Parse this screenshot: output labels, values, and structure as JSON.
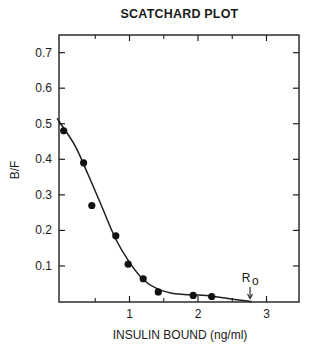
{
  "chart_data": {
    "type": "scatter",
    "title": "SCATCHARD PLOT",
    "xlabel": "INSULIN BOUND (ng/ml)",
    "ylabel": "B/F",
    "xlim": [
      0,
      3.5
    ],
    "ylim": [
      0,
      0.75
    ],
    "x_ticks": [
      1,
      2,
      3
    ],
    "x_minor_ticks": [
      0.5,
      1.5,
      2.5
    ],
    "y_ticks": [
      0.1,
      0.2,
      0.3,
      0.4,
      0.5,
      0.6,
      0.7
    ],
    "y_tick_labels": [
      "0.1",
      "0.2",
      "0.3",
      "0.4",
      "0.5",
      "0.6",
      "0.7"
    ],
    "x_tick_labels": [
      "1",
      "2",
      "3"
    ],
    "grid": false,
    "legend": null,
    "series": [
      {
        "name": "Measured points",
        "style": "filled-circle",
        "points": [
          {
            "x": 0.04,
            "y": 0.48
          },
          {
            "x": 0.33,
            "y": 0.39
          },
          {
            "x": 0.45,
            "y": 0.27
          },
          {
            "x": 0.8,
            "y": 0.185
          },
          {
            "x": 0.98,
            "y": 0.105
          },
          {
            "x": 1.2,
            "y": 0.064
          },
          {
            "x": 1.42,
            "y": 0.027
          },
          {
            "x": 1.93,
            "y": 0.017
          },
          {
            "x": 2.2,
            "y": 0.014
          }
        ]
      },
      {
        "name": "Fitted curve",
        "style": "line",
        "points": [
          {
            "x": 0.0,
            "y": 0.515
          },
          {
            "x": 0.2,
            "y": 0.44
          },
          {
            "x": 0.4,
            "y": 0.355
          },
          {
            "x": 0.6,
            "y": 0.265
          },
          {
            "x": 0.8,
            "y": 0.175
          },
          {
            "x": 1.0,
            "y": 0.11
          },
          {
            "x": 1.2,
            "y": 0.062
          },
          {
            "x": 1.4,
            "y": 0.036
          },
          {
            "x": 1.6,
            "y": 0.024
          },
          {
            "x": 1.8,
            "y": 0.02
          },
          {
            "x": 2.0,
            "y": 0.018
          },
          {
            "x": 2.2,
            "y": 0.015
          },
          {
            "x": 2.4,
            "y": 0.01
          },
          {
            "x": 2.6,
            "y": 0.004
          },
          {
            "x": 2.78,
            "y": 0.0
          }
        ]
      }
    ],
    "annotations": [
      {
        "text": "R",
        "subscript": "o",
        "x": 2.76,
        "y": 0.0,
        "marker": "down-arrow"
      }
    ]
  }
}
